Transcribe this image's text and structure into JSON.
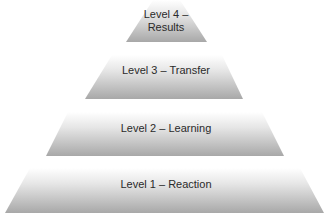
{
  "diagram": {
    "type": "pyramid",
    "colors": {
      "tier_top": "#ffffff",
      "tier_bottom": "#a9a9a9",
      "text": "#2a2a2a",
      "background": "#ffffff"
    },
    "tiers": [
      {
        "level": 4,
        "label_line1": "Level 4 –",
        "label_line2": "Results"
      },
      {
        "level": 3,
        "label": "Level 3 – Transfer"
      },
      {
        "level": 2,
        "label": "Level 2 – Learning"
      },
      {
        "level": 1,
        "label": "Level 1 – Reaction"
      }
    ]
  }
}
